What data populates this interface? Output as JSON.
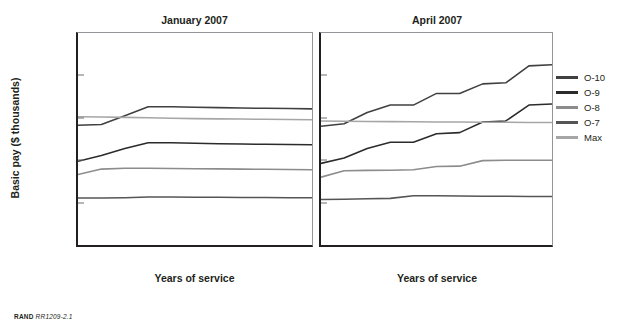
{
  "figure": {
    "ylabel": "Basic pay ($ thousands)",
    "xlabel_left": "Years of service",
    "xlabel_right": "Years of service",
    "footer_brand": "RAND",
    "footer_id": "RR1209-2.1"
  },
  "legend": {
    "position": "right",
    "items": [
      {
        "label": "O-10",
        "color": "#404040",
        "width": 3.2
      },
      {
        "label": "O-9",
        "color": "#2b2b2b",
        "width": 3.4
      },
      {
        "label": "O-8",
        "color": "#8c8c8c",
        "width": 2.6
      },
      {
        "label": "O-7",
        "color": "#555555",
        "width": 3.0
      },
      {
        "label": "Max",
        "color": "#a6a6a6",
        "width": 2.6
      }
    ]
  },
  "chart_data": [
    {
      "type": "line",
      "title": "January 2007",
      "xlabel": "Years of service",
      "ylabel": "Basic pay ($ thousands)",
      "categories": [
        "Over 20",
        "Over 22",
        "Over 24",
        "Over 26",
        "Over 28",
        "Over 30",
        "Over 32",
        "Over 34",
        "Over 36",
        "Over 38",
        "Over 40"
      ],
      "ylim": [
        8,
        18
      ],
      "yticks": [
        8,
        10,
        12,
        14,
        16,
        18
      ],
      "grid": false,
      "series": [
        {
          "name": "O-10",
          "color": "#404040",
          "values": [
            13.65,
            13.68,
            14.1,
            14.52,
            14.52,
            14.5,
            14.48,
            14.46,
            14.45,
            14.44,
            14.42
          ]
        },
        {
          "name": "O-9",
          "color": "#2b2b2b",
          "values": [
            11.95,
            12.22,
            12.55,
            12.82,
            12.82,
            12.8,
            12.78,
            12.76,
            12.75,
            12.74,
            12.73
          ]
        },
        {
          "name": "O-8",
          "color": "#8c8c8c",
          "values": [
            11.32,
            11.58,
            11.62,
            11.62,
            11.61,
            11.6,
            11.59,
            11.58,
            11.57,
            11.56,
            11.55
          ]
        },
        {
          "name": "O-7",
          "color": "#555555",
          "values": [
            10.22,
            10.22,
            10.23,
            10.26,
            10.26,
            10.25,
            10.25,
            10.24,
            10.24,
            10.23,
            10.23
          ]
        },
        {
          "name": "Max",
          "color": "#a6a6a6",
          "values": [
            14.05,
            14.04,
            14.02,
            14.0,
            13.98,
            13.96,
            13.95,
            13.94,
            13.93,
            13.92,
            13.91
          ]
        }
      ]
    },
    {
      "type": "line",
      "title": "April 2007",
      "xlabel": "Years of service",
      "ylabel": "Basic pay ($ thousands)",
      "categories": [
        "Over 20",
        "Over 22",
        "Over 24",
        "Over 26",
        "Over 28",
        "Over 30",
        "Over 32",
        "Over 34",
        "Over 36",
        "Over 38",
        "Over 40"
      ],
      "ylim": [
        8,
        18
      ],
      "yticks": [
        8,
        10,
        12,
        14,
        16,
        18
      ],
      "grid": false,
      "series": [
        {
          "name": "O-10",
          "color": "#404040",
          "values": [
            13.6,
            13.72,
            14.25,
            14.6,
            14.6,
            15.15,
            15.15,
            15.6,
            15.65,
            16.45,
            16.5
          ]
        },
        {
          "name": "O-9",
          "color": "#2b2b2b",
          "values": [
            11.85,
            12.1,
            12.55,
            12.85,
            12.85,
            13.25,
            13.3,
            13.8,
            13.85,
            14.6,
            14.65
          ]
        },
        {
          "name": "O-8",
          "color": "#8c8c8c",
          "values": [
            11.2,
            11.5,
            11.52,
            11.53,
            11.55,
            11.7,
            11.72,
            11.98,
            12.0,
            12.0,
            12.0
          ]
        },
        {
          "name": "O-7",
          "color": "#555555",
          "values": [
            10.15,
            10.16,
            10.18,
            10.2,
            10.32,
            10.32,
            10.31,
            10.3,
            10.3,
            10.29,
            10.29
          ]
        },
        {
          "name": "Max",
          "color": "#a6a6a6",
          "values": [
            13.85,
            13.84,
            13.83,
            13.82,
            13.81,
            13.8,
            13.8,
            13.79,
            13.79,
            13.78,
            13.78
          ]
        }
      ]
    }
  ]
}
